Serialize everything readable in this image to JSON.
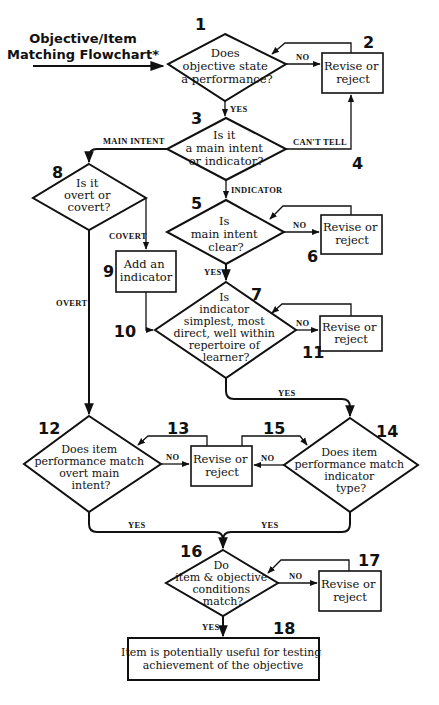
{
  "title": {
    "line1": "Objective/Item",
    "line2": "Matching Flowchart*"
  },
  "nodes": {
    "n1": {
      "number": "1",
      "type": "decision",
      "lines": [
        "Does",
        "objective state",
        "a performance?"
      ]
    },
    "n2": {
      "number": "2",
      "type": "process",
      "lines": [
        "Revise or",
        "reject"
      ]
    },
    "n3": {
      "number": "3",
      "type": "decision",
      "lines": [
        "Is it",
        "a main intent",
        "or indicator?"
      ]
    },
    "n4": {
      "number": "4",
      "type": "marker"
    },
    "n5": {
      "number": "5",
      "type": "decision",
      "lines": [
        "Is",
        "main intent",
        "clear?"
      ]
    },
    "n6": {
      "number": "6",
      "type": "process",
      "lines": [
        "Revise or",
        "reject"
      ]
    },
    "n7": {
      "number": "7",
      "type": "decision",
      "lines": [
        "Is",
        "indicator",
        "simplest, most",
        "direct, well within",
        "repertoire of",
        "learner?"
      ]
    },
    "n8": {
      "number": "8",
      "type": "decision",
      "lines": [
        "Is it",
        "overt or",
        "covert?"
      ]
    },
    "n9": {
      "number": "9",
      "type": "process",
      "lines": [
        "Add an",
        "indicator"
      ]
    },
    "n10": {
      "number": "10",
      "type": "marker"
    },
    "n11": {
      "number": "11",
      "type": "process",
      "lines": [
        "Revise or",
        "reject"
      ]
    },
    "n12": {
      "number": "12",
      "type": "decision",
      "lines": [
        "Does item",
        "performance match",
        "overt main",
        "intent?"
      ]
    },
    "n13": {
      "number": "13",
      "type": "process",
      "lines": [
        "Revise or",
        "reject"
      ]
    },
    "n14": {
      "number": "14",
      "type": "decision",
      "lines": [
        "Does item",
        "performance match",
        "indicator",
        "type?"
      ]
    },
    "n15": {
      "number": "15",
      "type": "marker"
    },
    "n16": {
      "number": "16",
      "type": "decision",
      "lines": [
        "Do",
        "item & objective",
        "conditions",
        "match?"
      ]
    },
    "n17": {
      "number": "17",
      "type": "process",
      "lines": [
        "Revise or",
        "reject"
      ]
    },
    "n18": {
      "number": "18",
      "type": "terminal",
      "lines": [
        "Item is potentially useful for testing",
        "achievement of the objective"
      ]
    }
  },
  "edges": {
    "e1_2": "NO",
    "e1_3": "YES",
    "e3_8": "MAIN INTENT",
    "e3_4": "CAN'T TELL",
    "e3_5": "INDICATOR",
    "e5_6": "NO",
    "e5_7": "YES",
    "e8_9": "COVERT",
    "e8_12": "OVERT",
    "e7_11": "NO",
    "e7_14": "YES",
    "e12_13": "NO",
    "e14_13": "NO",
    "e12_16": "YES",
    "e14_16": "YES",
    "e16_17": "NO",
    "e16_18": "YES"
  },
  "colors": {
    "ink": "#111111",
    "background": "#ffffff"
  }
}
